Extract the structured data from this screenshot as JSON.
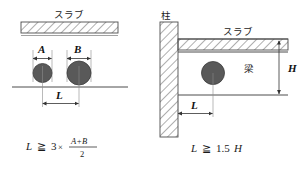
{
  "figure": {
    "left_panel": {
      "slab_label": "スラブ",
      "dim_a_label": "A",
      "dim_b_label": "B",
      "dim_l_label": "L",
      "formula": {
        "variable": "L",
        "relation": "≧",
        "factor": "3",
        "times": "×",
        "numerator": "A+B",
        "denominator": "2",
        "full_text": "L ≧ 3 × (A+B)/2"
      },
      "elements": {
        "slab_name": "hatched-slab-band",
        "pipe_a_name": "pipe-a",
        "pipe_b_name": "pipe-b",
        "ground_line_name": "reference-line"
      }
    },
    "right_panel": {
      "column_label": "柱",
      "slab_label": "スラブ",
      "beam_label": "梁",
      "dim_h_label": "H",
      "dim_l_label": "L",
      "formula": {
        "variable": "L",
        "relation": "≧",
        "value": "1.5",
        "variable2": "H",
        "full_text": "L ≧ 1.5H"
      },
      "elements": {
        "column_name": "hatched-column",
        "slab_name": "hatched-slab-band",
        "pipe_name": "pipe",
        "beam_bottom_line_name": "beam-bottom-line"
      }
    }
  },
  "colors": {
    "background": "#ffffff",
    "line": "#4d4d4d",
    "pipe_fill": "#595959",
    "pipe_stroke": "#3d3d3d",
    "hatch": "#6b6b6b",
    "text": "#1a1a1a"
  }
}
